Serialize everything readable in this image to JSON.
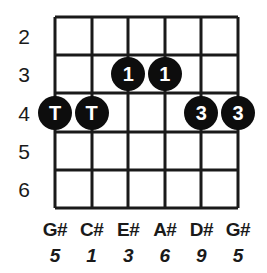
{
  "diagram": {
    "type": "guitar-chord-fretboard",
    "colors": {
      "grid": "#1a1a1a",
      "dot_fill": "#0d0d0d",
      "dot_text": "#ffffff",
      "background": "#ffffff"
    },
    "geometry": {
      "string_count": 6,
      "fret_space_count": 5,
      "grid_left": 55,
      "grid_top": 17,
      "grid_width": 183,
      "grid_height": 191,
      "string_x": [
        55,
        91.6,
        128.2,
        164.8,
        201.4,
        238
      ],
      "fret_y": [
        17,
        55.2,
        93.4,
        131.6,
        169.8,
        208
      ]
    },
    "fret_numbers": [
      {
        "label": "2",
        "space_index": 0
      },
      {
        "label": "3",
        "space_index": 1
      },
      {
        "label": "4",
        "space_index": 2
      },
      {
        "label": "5",
        "space_index": 3
      },
      {
        "label": "6",
        "space_index": 4
      }
    ],
    "dots": [
      {
        "label": "T",
        "string_index": 0,
        "space_index": 2,
        "name": "fret-dot-string1-fret4"
      },
      {
        "label": "T",
        "string_index": 1,
        "space_index": 2,
        "name": "fret-dot-string2-fret4"
      },
      {
        "label": "1",
        "string_index": 2,
        "space_index": 1,
        "name": "fret-dot-string3-fret3"
      },
      {
        "label": "1",
        "string_index": 3,
        "space_index": 1,
        "name": "fret-dot-string4-fret3"
      },
      {
        "label": "3",
        "string_index": 4,
        "space_index": 2,
        "name": "fret-dot-string5-fret4"
      },
      {
        "label": "3",
        "string_index": 5,
        "space_index": 2,
        "name": "fret-dot-string6-fret4"
      }
    ],
    "note_labels": [
      "G#",
      "C#",
      "E#",
      "A#",
      "D#",
      "G#"
    ],
    "interval_labels": [
      "5",
      "1",
      "3",
      "6",
      "9",
      "5"
    ],
    "note_row_y": 220,
    "interval_row_y": 246
  }
}
